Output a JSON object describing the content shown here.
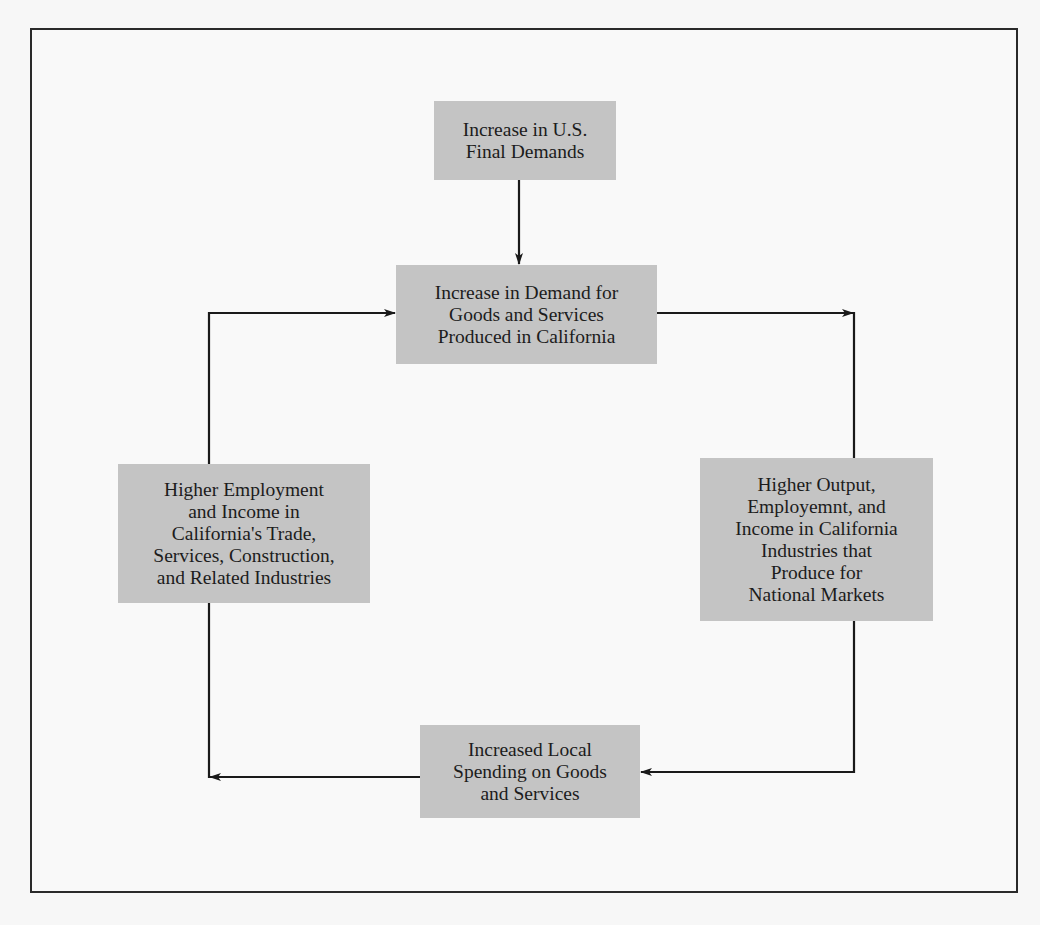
{
  "diagram": {
    "type": "flowchart-cycle",
    "nodes": [
      {
        "id": "us_final_demand",
        "label": "Increase in U.S.\nFinal Demands"
      },
      {
        "id": "ca_demand",
        "label": "Increase in Demand for\nGoods and Services\nProduced in California"
      },
      {
        "id": "local_industries",
        "label": "Higher Employment\nand Income in\nCalifornia's Trade,\nServices, Construction,\nand Related Industries"
      },
      {
        "id": "national_industries",
        "label": "Higher Output,\nEmployemnt, and\nIncome in California\nIndustries that\nProduce for\nNational Markets"
      },
      {
        "id": "local_spending",
        "label": "Increased Local\nSpending on Goods\nand Services"
      }
    ],
    "edges": [
      {
        "from": "us_final_demand",
        "to": "ca_demand"
      },
      {
        "from": "ca_demand",
        "to": "national_industries"
      },
      {
        "from": "national_industries",
        "to": "local_spending"
      },
      {
        "from": "local_spending",
        "to": "local_industries"
      },
      {
        "from": "local_industries",
        "to": "ca_demand"
      }
    ],
    "colors": {
      "box_fill": "#c4c4c4",
      "line": "#1a1a1a",
      "frame": "#2a2a2a",
      "background": "#f9f9f9"
    }
  }
}
